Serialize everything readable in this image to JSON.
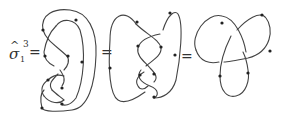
{
  "figure": {
    "lhs": {
      "symbol": "σ",
      "hat": "^",
      "subscript": "1",
      "superscript": "3"
    },
    "equals": [
      "=",
      "=",
      "="
    ],
    "panels": [
      {
        "name": "closed-braid-sigma1-cubed",
        "description": "Closure of braid σ1^3 with nested outer loops"
      },
      {
        "name": "intermediate-isotopy",
        "description": "Isotoped diagram with twisted central crossings"
      },
      {
        "name": "trefoil-knot",
        "description": "Standard trefoil knot diagram"
      }
    ],
    "colors": {
      "stroke": "#444444",
      "marker": "#222222"
    }
  }
}
